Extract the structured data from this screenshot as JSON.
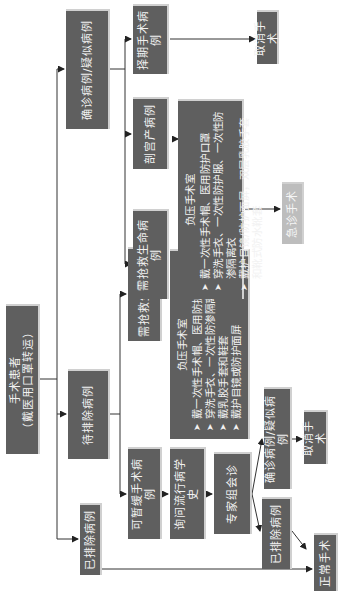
{
  "diagram": {
    "orientation": "rotated -90deg (text reads bottom-to-top)",
    "colors": {
      "box_fill": "#5f5f5f",
      "box_text": "#f2f2f2",
      "emergency_fill": "#bdbdbd",
      "line": "#333333"
    },
    "root": {
      "title": "手术患者",
      "subtitle": "（戴医用口罩转运）"
    },
    "level1": {
      "excluded": "已排除病例",
      "pending": "待排除病例",
      "confirmed": "确诊病例/疑似病例"
    },
    "pending_branch": {
      "deferrable": "可暂缓手术病例",
      "urgent": "需抢救生命病例",
      "epi_history": "询问流行病学史",
      "expert_consult": "专家组会诊",
      "consult_excluded": "已排除病例",
      "consult_confirmed": "确诊病例/疑似病例",
      "cancel": "取消手术",
      "normal_surgery": "正常手术",
      "ppe": {
        "title": "负压手术室",
        "items": [
          "戴一次性手术帽、医用防护口罩",
          "穿洗手衣、一次性防渗隔离衣",
          "戴乳胶手套和鞋套",
          "戴护目镜或防护面屏"
        ]
      }
    },
    "confirmed_branch": {
      "elective": "择期手术病例",
      "cesarean": "剖宫产病例",
      "urgent": "需抢救生命病例",
      "cancel": "取消手术",
      "emergency_surgery": "急诊手术",
      "ppe": {
        "title": "负压手术室",
        "items": [
          "戴一次性手术帽、医用防护口罩",
          "穿洗手衣、一次性防护服、一次性防渗隔离衣",
          "戴护目镜/防护面屏，双层乳胶手套和靴式防水靴套"
        ]
      }
    }
  }
}
